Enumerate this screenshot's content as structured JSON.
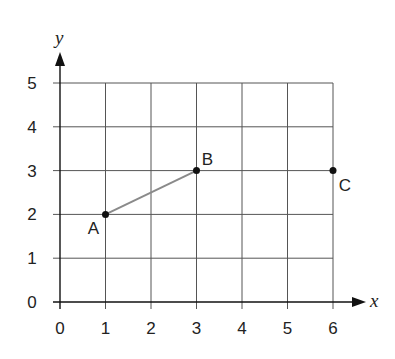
{
  "chart_data": {
    "type": "scatter",
    "title": "",
    "xlabel": "x",
    "ylabel": "y",
    "xlim": [
      0,
      6
    ],
    "ylim": [
      0,
      5
    ],
    "grid": true,
    "x_ticks": [
      "0",
      "1",
      "2",
      "3",
      "4",
      "5",
      "6"
    ],
    "y_ticks": [
      "0",
      "1",
      "2",
      "3",
      "4",
      "5"
    ],
    "points": [
      {
        "label": "A",
        "x": 1,
        "y": 2
      },
      {
        "label": "B",
        "x": 3,
        "y": 3
      },
      {
        "label": "C",
        "x": 6,
        "y": 3
      }
    ],
    "segments": [
      {
        "from": "A",
        "to": "B",
        "color": "#8a8a8a"
      }
    ]
  },
  "colors": {
    "grid": "#555555",
    "axis": "#111111",
    "segment": "#8a8a8a",
    "point": "#111111"
  }
}
